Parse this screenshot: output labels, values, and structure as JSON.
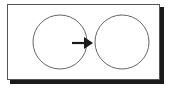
{
  "diagram": {
    "nodes": [
      {
        "id": "left-circle",
        "cx": 60,
        "cy": 42,
        "r": 27
      },
      {
        "id": "right-circle",
        "cx": 122,
        "cy": 42,
        "r": 27
      }
    ],
    "edges": [
      {
        "from": "left-circle",
        "to": "right-circle",
        "style": "solid-arrow"
      }
    ],
    "colors": {
      "stroke": "#555555",
      "arrow": "#1a1a1a",
      "shadow": "#1a1a1a",
      "background": "#ffffff"
    }
  }
}
